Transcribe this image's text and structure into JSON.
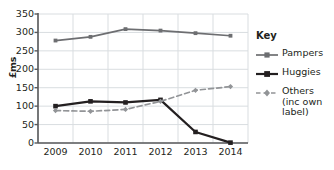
{
  "chart_data": {
    "type": "line",
    "title": "",
    "xlabel": "",
    "ylabel": "£ms",
    "categories": [
      "2009",
      "2010",
      "2011",
      "2012",
      "2013",
      "2014"
    ],
    "ylim": [
      0,
      350
    ],
    "yticks": [
      0,
      50,
      100,
      150,
      200,
      250,
      300,
      350
    ],
    "grid": true,
    "legend_position": "right",
    "legend_title": "Key",
    "series": [
      {
        "name": "Pampers",
        "values": [
          278,
          288,
          309,
          305,
          298,
          291
        ],
        "color": "#6d6e71",
        "style": "solid",
        "marker": "square"
      },
      {
        "name": "Huggies",
        "values": [
          100,
          113,
          110,
          117,
          30,
          1
        ],
        "color": "#231f20",
        "style": "solid",
        "marker": "square"
      },
      {
        "name": "Others (inc own label)",
        "values": [
          88,
          86,
          91,
          113,
          143,
          153
        ],
        "color": "#929497",
        "style": "dashed",
        "marker": "diamond"
      }
    ]
  },
  "legend": {
    "title": "Key",
    "items": [
      {
        "label": "Pampers"
      },
      {
        "label": "Huggies"
      },
      {
        "label_line1": "Others",
        "label_line2": "(inc own",
        "label_line3": "label)"
      }
    ]
  },
  "axis": {
    "y_label": "£ms",
    "y_ticks": [
      "0",
      "50",
      "100",
      "150",
      "200",
      "250",
      "300",
      "350"
    ],
    "x_ticks": [
      "2009",
      "2010",
      "2011",
      "2012",
      "2013",
      "2014"
    ]
  },
  "colors": {
    "pampers": "#6d6e71",
    "huggies": "#231f20",
    "others": "#929497",
    "grid": "#d9dde0",
    "axis": "#58595b",
    "background": "#ffffff"
  }
}
